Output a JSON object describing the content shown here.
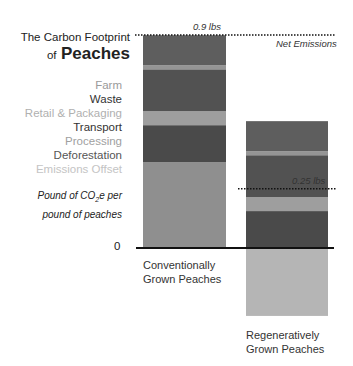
{
  "title": {
    "line1": "The Carbon Footprint",
    "of": "of",
    "subject": "Peaches"
  },
  "unit_label": {
    "line1_pre": "Pound of CO",
    "line1_sub": "2",
    "line1_post": "e per",
    "line2": "pound of peaches"
  },
  "chart_data": {
    "type": "bar",
    "stacked": true,
    "ylabel": "Pound of CO2e per pound of peaches",
    "ylim": [
      -0.3,
      0.9
    ],
    "zero_label": "0",
    "categories": [
      "Conventionally Grown Peaches",
      "Regeneratively Grown Peaches"
    ],
    "category_lines": [
      [
        "Conventionally",
        "Grown Peaches"
      ],
      [
        "Regeneratively",
        "Grown Peaches"
      ]
    ],
    "series": [
      {
        "name": "Farm",
        "color": "#8f8f8f",
        "label_color": "#9a9a9a",
        "values": [
          0.363,
          0
        ]
      },
      {
        "name": "Waste",
        "color": "#4a4a4a",
        "label_color": "#333333",
        "values": [
          0.156,
          0.156
        ]
      },
      {
        "name": "Retail & Packaging",
        "color": "#9e9e9e",
        "label_color": "#b0b0b0",
        "values": [
          0.059,
          0.059
        ]
      },
      {
        "name": "Transport",
        "color": "#525252",
        "label_color": "#333333",
        "values": [
          0.177,
          0.177
        ]
      },
      {
        "name": "Processing",
        "color": "#959595",
        "label_color": "#a0a0a0",
        "values": [
          0.017,
          0.017
        ]
      },
      {
        "name": "Deforestation",
        "color": "#5e5e5e",
        "label_color": "#555555",
        "values": [
          0.127,
          0.127
        ]
      },
      {
        "name": "Emissions Offset",
        "color": "#b5b5b5",
        "label_color": "#c4c4c4",
        "values": [
          0,
          -0.287
        ]
      }
    ],
    "net_emissions": [
      0.9,
      0.25
    ],
    "annotations": [
      {
        "text": "0.9 lbs",
        "value": 0.9
      },
      {
        "text": "Net Emissions",
        "value": 0.9
      },
      {
        "text": "0.25 lbs",
        "value": 0.25
      }
    ],
    "legend": "left"
  }
}
